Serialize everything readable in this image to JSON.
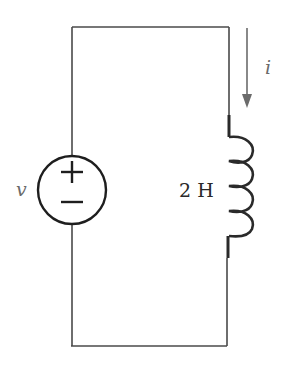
{
  "diagram": {
    "type": "circuit",
    "components": [
      {
        "id": "source",
        "kind": "voltage-source",
        "label": "v",
        "polarity": {
          "plus": "+",
          "minus": "−"
        }
      },
      {
        "id": "inductor",
        "kind": "inductor",
        "label": "2 H",
        "value": 2,
        "unit": "H"
      }
    ],
    "current": {
      "label": "i",
      "direction": "down"
    },
    "colors": {
      "wire": "#4a4a4a",
      "component": "#1e1e1e",
      "arrow": "#6b6b6b",
      "variable_label": "#6a6a6a"
    }
  }
}
